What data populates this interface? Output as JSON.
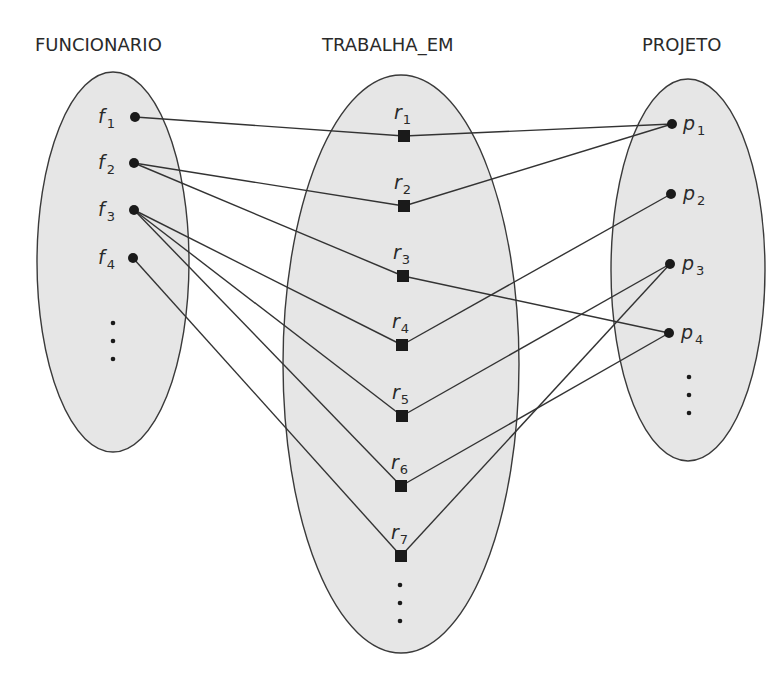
{
  "diagram": {
    "type": "relationship-instance-diagram",
    "sets": {
      "funcionario": {
        "title": "FUNCIONARIO",
        "nodes": [
          {
            "id": "f1",
            "letter": "f",
            "sub": "1"
          },
          {
            "id": "f2",
            "letter": "f",
            "sub": "2"
          },
          {
            "id": "f3",
            "letter": "f",
            "sub": "3"
          },
          {
            "id": "f4",
            "letter": "f",
            "sub": "4"
          }
        ],
        "has_more": true
      },
      "trabalha_em": {
        "title": "TRABALHA_EM",
        "nodes": [
          {
            "id": "r1",
            "letter": "r",
            "sub": "1"
          },
          {
            "id": "r2",
            "letter": "r",
            "sub": "2"
          },
          {
            "id": "r3",
            "letter": "r",
            "sub": "3"
          },
          {
            "id": "r4",
            "letter": "r",
            "sub": "4"
          },
          {
            "id": "r5",
            "letter": "r",
            "sub": "5"
          },
          {
            "id": "r6",
            "letter": "r",
            "sub": "6"
          },
          {
            "id": "r7",
            "letter": "r",
            "sub": "7"
          }
        ],
        "has_more": true
      },
      "projeto": {
        "title": "PROJETO",
        "nodes": [
          {
            "id": "p1",
            "letter": "p",
            "sub": "1"
          },
          {
            "id": "p2",
            "letter": "p",
            "sub": "2"
          },
          {
            "id": "p3",
            "letter": "p",
            "sub": "3"
          },
          {
            "id": "p4",
            "letter": "p",
            "sub": "4"
          }
        ],
        "has_more": true
      }
    },
    "edges": [
      [
        "f1",
        "r1"
      ],
      [
        "f2",
        "r2"
      ],
      [
        "f2",
        "r3"
      ],
      [
        "f3",
        "r4"
      ],
      [
        "f3",
        "r5"
      ],
      [
        "f3",
        "r6"
      ],
      [
        "f4",
        "r7"
      ],
      [
        "r1",
        "p1"
      ],
      [
        "r2",
        "p1"
      ],
      [
        "r3",
        "p4"
      ],
      [
        "r4",
        "p2"
      ],
      [
        "r5",
        "p3"
      ],
      [
        "r6",
        "p4"
      ],
      [
        "r7",
        "p3"
      ]
    ],
    "colors": {
      "ellipse_fill": "#e6e6e6",
      "stroke": "#3a3a3a",
      "node": "#1a1a1a"
    }
  }
}
